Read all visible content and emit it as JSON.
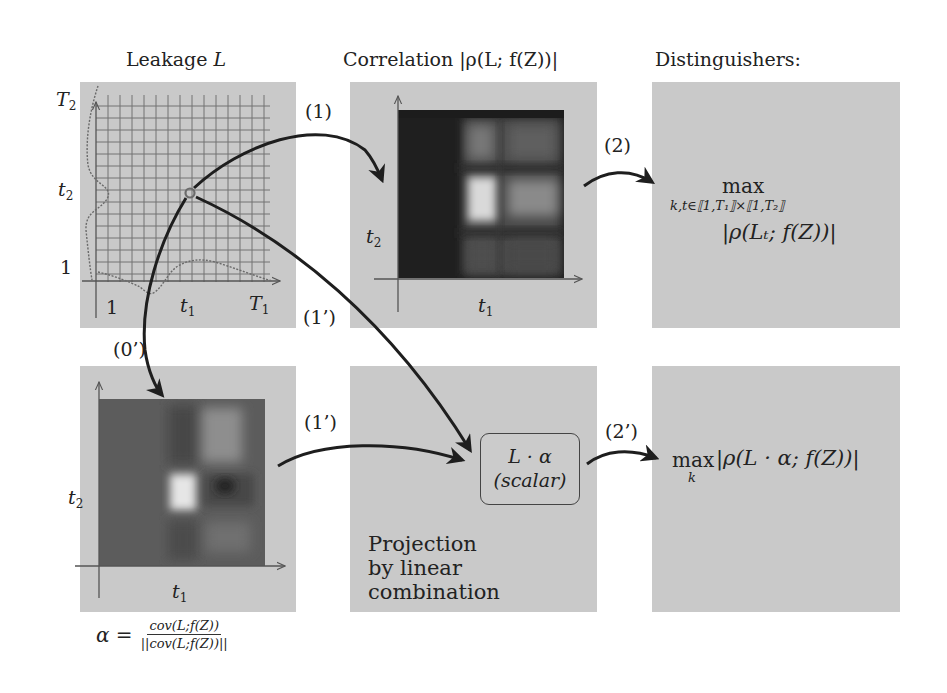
{
  "titles": {
    "leakage": "Leakage ",
    "leakage_var": "L",
    "correlation": "Correlation |ρ(L; f(Z))|",
    "distinguishers": "Distinguishers:"
  },
  "leakage_panel": {
    "y_top_label": "T",
    "y_top_sub": "2",
    "y_mid_label": "t",
    "y_mid_sub": "2",
    "y_low_label": "1",
    "x_low_label": "1",
    "x_mid_label": "t",
    "x_mid_sub": "1",
    "x_top_label": "T",
    "x_top_sub": "1"
  },
  "correlation_panel": {
    "y_label": "t",
    "y_sub": "2",
    "x_label": "t",
    "x_sub": "1"
  },
  "alpha_panel": {
    "y_label": "t",
    "y_sub": "2",
    "x_label": "t",
    "x_sub": "1",
    "formula_lhs": "α =",
    "formula_num": "cov(L;f(Z))",
    "formula_den": "||cov(L;f(Z))||"
  },
  "projection_panel": {
    "scalar_line1": "L · α",
    "scalar_line2": "(scalar)",
    "caption_line1": "Projection",
    "caption_line2": "by linear",
    "caption_line3": "combination"
  },
  "distinguisher_top": {
    "max": "max",
    "subscript": "k,t∈⟦1,T₁⟧×⟦1,T₂⟧",
    "expr": "|ρ(Lₜ; f(Z))|"
  },
  "distinguisher_bottom": {
    "max": "max",
    "subscript": "k",
    "expr": "|ρ(L · α; f(Z))|"
  },
  "arrows": {
    "a1": "(1)",
    "a2": "(2)",
    "a0p": "(0’)",
    "a1p_top": "(1’)",
    "a1p_bottom": "(1’)",
    "a2p": "(2’)"
  },
  "colors": {
    "panel_bg": "#c9c9c9",
    "arrow": "#1e1e1e",
    "grid": "#6f6f6f",
    "corr_heatmap_bg": "#1f1f1f",
    "alpha_heatmap_bg": "#5c5c5c"
  }
}
